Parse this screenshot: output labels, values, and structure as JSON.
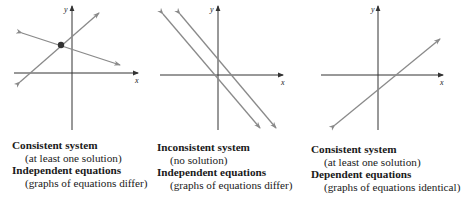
{
  "panels": [
    {
      "axis_labels": {
        "x": "x",
        "y": "y"
      },
      "system_type": "Consistent system",
      "system_note": "(at least one solution)",
      "equation_type": "Independent equations",
      "equation_note": "(graphs of equations differ)",
      "description": "Two lines intersecting at a single point"
    },
    {
      "axis_labels": {
        "x": "x",
        "y": "y"
      },
      "system_type": "Inconsistent system",
      "system_note": "(no solution)",
      "equation_type": "Independent equations",
      "equation_note": "(graphs of equations differ)",
      "description": "Two parallel lines"
    },
    {
      "axis_labels": {
        "x": "x",
        "y": "y"
      },
      "system_type": "Consistent system",
      "system_note": "(at least one solution)",
      "equation_type": "Dependent equations",
      "equation_note": "(graphs of equations identical)",
      "description": "Two coincident lines (one line)"
    }
  ],
  "colors": {
    "axis": "#333333",
    "line": "#8a8a8a",
    "point": "#333333"
  }
}
